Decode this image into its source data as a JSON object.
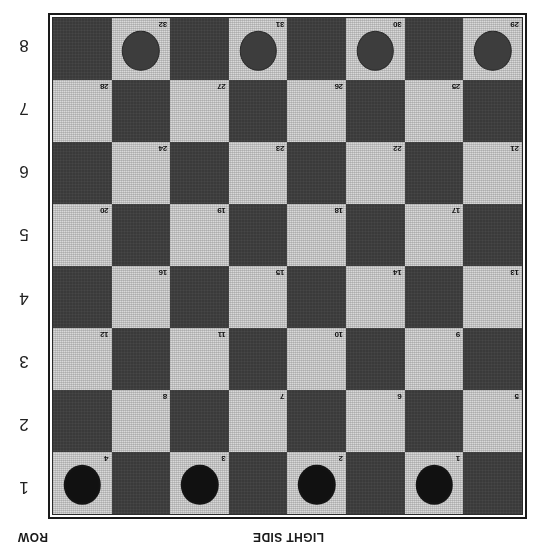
{
  "diagram": {
    "orientation": "rotated-180",
    "row_caption": "ROW",
    "side_caption": "LIGHT SIDE",
    "colors": {
      "dark_square": "#3a3a3a",
      "light_square": "#d9d9d9",
      "black_piece": "#111111",
      "gray_piece": "#3d3d3d",
      "frame": "#1a1a1a",
      "page_background": "#ffffff"
    },
    "row_labels": [
      "1",
      "2",
      "3",
      "4",
      "5",
      "6",
      "7",
      "8"
    ],
    "board": {
      "columns": 8,
      "rows": 8,
      "numbered_squares": 32,
      "rows_data": [
        {
          "row": "1",
          "squares": [
            {
              "shade": "dark",
              "number": "",
              "piece": ""
            },
            {
              "shade": "light",
              "number": "1",
              "piece": "black"
            },
            {
              "shade": "dark",
              "number": "",
              "piece": ""
            },
            {
              "shade": "light",
              "number": "2",
              "piece": "black"
            },
            {
              "shade": "dark",
              "number": "",
              "piece": ""
            },
            {
              "shade": "light",
              "number": "3",
              "piece": "black"
            },
            {
              "shade": "dark",
              "number": "",
              "piece": ""
            },
            {
              "shade": "light",
              "number": "4",
              "piece": "black"
            }
          ]
        },
        {
          "row": "2",
          "squares": [
            {
              "shade": "light",
              "number": "5",
              "piece": ""
            },
            {
              "shade": "dark",
              "number": "",
              "piece": ""
            },
            {
              "shade": "light",
              "number": "6",
              "piece": ""
            },
            {
              "shade": "dark",
              "number": "",
              "piece": ""
            },
            {
              "shade": "light",
              "number": "7",
              "piece": ""
            },
            {
              "shade": "dark",
              "number": "",
              "piece": ""
            },
            {
              "shade": "light",
              "number": "8",
              "piece": ""
            },
            {
              "shade": "dark",
              "number": "",
              "piece": ""
            }
          ]
        },
        {
          "row": "3",
          "squares": [
            {
              "shade": "dark",
              "number": "",
              "piece": ""
            },
            {
              "shade": "light",
              "number": "9",
              "piece": ""
            },
            {
              "shade": "dark",
              "number": "",
              "piece": ""
            },
            {
              "shade": "light",
              "number": "10",
              "piece": ""
            },
            {
              "shade": "dark",
              "number": "",
              "piece": ""
            },
            {
              "shade": "light",
              "number": "11",
              "piece": ""
            },
            {
              "shade": "dark",
              "number": "",
              "piece": ""
            },
            {
              "shade": "light",
              "number": "12",
              "piece": ""
            }
          ]
        },
        {
          "row": "4",
          "squares": [
            {
              "shade": "light",
              "number": "13",
              "piece": ""
            },
            {
              "shade": "dark",
              "number": "",
              "piece": ""
            },
            {
              "shade": "light",
              "number": "14",
              "piece": ""
            },
            {
              "shade": "dark",
              "number": "",
              "piece": ""
            },
            {
              "shade": "light",
              "number": "15",
              "piece": ""
            },
            {
              "shade": "dark",
              "number": "",
              "piece": ""
            },
            {
              "shade": "light",
              "number": "16",
              "piece": ""
            },
            {
              "shade": "dark",
              "number": "",
              "piece": ""
            }
          ]
        },
        {
          "row": "5",
          "squares": [
            {
              "shade": "dark",
              "number": "",
              "piece": ""
            },
            {
              "shade": "light",
              "number": "17",
              "piece": ""
            },
            {
              "shade": "dark",
              "number": "",
              "piece": ""
            },
            {
              "shade": "light",
              "number": "18",
              "piece": ""
            },
            {
              "shade": "dark",
              "number": "",
              "piece": ""
            },
            {
              "shade": "light",
              "number": "19",
              "piece": ""
            },
            {
              "shade": "dark",
              "number": "",
              "piece": ""
            },
            {
              "shade": "light",
              "number": "20",
              "piece": ""
            }
          ]
        },
        {
          "row": "6",
          "squares": [
            {
              "shade": "light",
              "number": "21",
              "piece": ""
            },
            {
              "shade": "dark",
              "number": "",
              "piece": ""
            },
            {
              "shade": "light",
              "number": "22",
              "piece": ""
            },
            {
              "shade": "dark",
              "number": "",
              "piece": ""
            },
            {
              "shade": "light",
              "number": "23",
              "piece": ""
            },
            {
              "shade": "dark",
              "number": "",
              "piece": ""
            },
            {
              "shade": "light",
              "number": "24",
              "piece": ""
            },
            {
              "shade": "dark",
              "number": "",
              "piece": ""
            }
          ]
        },
        {
          "row": "7",
          "squares": [
            {
              "shade": "dark",
              "number": "",
              "piece": ""
            },
            {
              "shade": "light",
              "number": "25",
              "piece": ""
            },
            {
              "shade": "dark",
              "number": "",
              "piece": ""
            },
            {
              "shade": "light",
              "number": "26",
              "piece": ""
            },
            {
              "shade": "dark",
              "number": "",
              "piece": ""
            },
            {
              "shade": "light",
              "number": "27",
              "piece": ""
            },
            {
              "shade": "dark",
              "number": "",
              "piece": ""
            },
            {
              "shade": "light",
              "number": "28",
              "piece": ""
            }
          ]
        },
        {
          "row": "8",
          "squares": [
            {
              "shade": "light",
              "number": "29",
              "piece": "gray"
            },
            {
              "shade": "dark",
              "number": "",
              "piece": ""
            },
            {
              "shade": "light",
              "number": "30",
              "piece": "gray"
            },
            {
              "shade": "dark",
              "number": "",
              "piece": ""
            },
            {
              "shade": "light",
              "number": "31",
              "piece": "gray"
            },
            {
              "shade": "dark",
              "number": "",
              "piece": ""
            },
            {
              "shade": "light",
              "number": "32",
              "piece": "gray"
            },
            {
              "shade": "dark",
              "number": "",
              "piece": ""
            }
          ]
        }
      ]
    }
  }
}
